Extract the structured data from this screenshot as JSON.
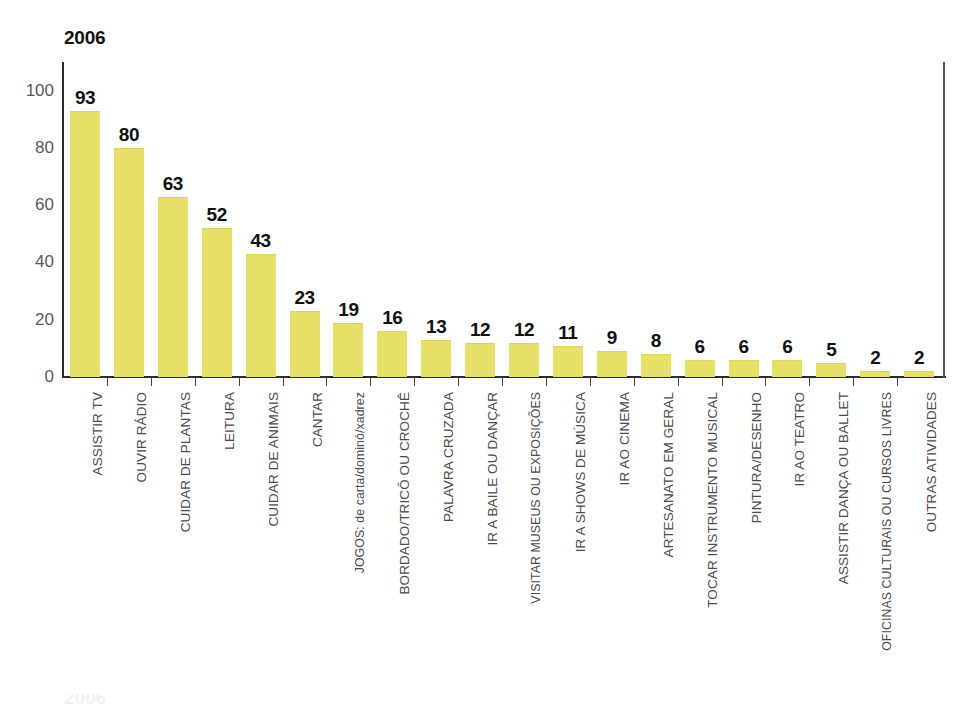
{
  "chart_data": {
    "type": "bar",
    "title": "2006",
    "xlabel": "",
    "ylabel": "",
    "ylim": [
      0,
      110
    ],
    "yticks": [
      0,
      20,
      40,
      60,
      80,
      100
    ],
    "grid": false,
    "legend": null,
    "bar_color": "#e6e069",
    "axis_color": "#2b2b2b",
    "categories": [
      "ASSISTIR TV",
      "OUVIR RÁDIO",
      "CUIDAR DE PLANTAS",
      "LEITURA",
      "CUIDAR DE ANIMAIS",
      "CANTAR",
      "JOGOS: de carta/dominó/xadrez",
      "BORDADO/TRICÔ OU CROCHÊ",
      "PALAVRA CRUZADA",
      "IR A BAILE OU DANÇAR",
      "VISITAR MUSEUS OU EXPOSIÇÕES",
      "IR A SHOWS DE MÚSICA",
      "IR AO CINEMA",
      "ARTESANATO EM GERAL",
      "TOCAR INSTRUMENTO MUSICAL",
      "PINTURA/DESENHO",
      "IR AO TEATRO",
      "ASSISTIR DANÇA OU BALLET",
      "OFICINAS CULTURAIS OU CURSOS LIVRES",
      "OUTRAS ATIVIDADES"
    ],
    "values": [
      93,
      80,
      63,
      52,
      43,
      23,
      19,
      16,
      13,
      12,
      12,
      11,
      9,
      8,
      6,
      6,
      6,
      5,
      2,
      2
    ]
  },
  "footer": {
    "clipped_text": "2006"
  }
}
